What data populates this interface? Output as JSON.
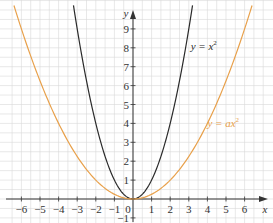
{
  "chart_data": {
    "type": "line",
    "title": "",
    "xlabel": "x",
    "ylabel": "y",
    "xlim": [
      -6.6,
      7.0
    ],
    "ylim": [
      -1.3,
      10.5
    ],
    "x_ticks": [
      -6,
      -5,
      -4,
      -3,
      -2,
      -1,
      0,
      1,
      2,
      3,
      4,
      5,
      6
    ],
    "x_tick_labels": [
      "−6",
      "−5",
      "−4",
      "−3",
      "−2",
      "−1",
      "0",
      "1",
      "2",
      "3",
      "4",
      "5",
      "6"
    ],
    "y_ticks": [
      -1,
      1,
      2,
      3,
      4,
      5,
      6,
      7,
      8,
      9
    ],
    "y_tick_labels": [
      "−1",
      "1",
      "2",
      "3",
      "4",
      "5",
      "6",
      "7",
      "8",
      "9"
    ],
    "grid": true,
    "grid_step": 0.5,
    "legend": "none (inline curve labels)",
    "series": [
      {
        "name": "y = x²",
        "label_main": "y = x",
        "label_sup": "2",
        "formula": "y = x^2",
        "coefficient": 1,
        "color": "#2a2a2a",
        "label_position": {
          "x": 3.1,
          "y": 7.9
        },
        "x": [
          -3.2,
          -3,
          -2.5,
          -2,
          -1.5,
          -1,
          -0.5,
          0,
          0.5,
          1,
          1.5,
          2,
          2.5,
          3,
          3.2
        ],
        "y": [
          10.24,
          9,
          6.25,
          4,
          2.25,
          1,
          0.25,
          0,
          0.25,
          1,
          2.25,
          4,
          6.25,
          9,
          10.24
        ]
      },
      {
        "name": "y = ax²",
        "label_main": "y = ax",
        "label_sup": "2",
        "formula": "y = a x^2 (a ≈ 0.25)",
        "coefficient": 0.25,
        "color": "#e8a04a",
        "label_position": {
          "x": 4.0,
          "y": 3.8
        },
        "x": [
          -6.4,
          -6,
          -5,
          -4,
          -3,
          -2,
          -1,
          0,
          1,
          2,
          3,
          4,
          5,
          6,
          6.4
        ],
        "y": [
          10.24,
          9,
          6.25,
          4,
          2.25,
          1,
          0.25,
          0,
          0.25,
          1,
          2.25,
          4,
          6.25,
          9,
          10.24
        ]
      }
    ]
  },
  "colors": {
    "grid": "#d9d9d9",
    "axis": "#333333",
    "text": "#333333"
  }
}
